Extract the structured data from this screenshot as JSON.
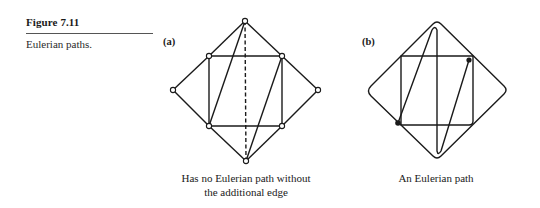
{
  "figure": {
    "label": "Figure 7.11",
    "caption": "Eulerian paths."
  },
  "panels": [
    {
      "id": "a",
      "label": "(a)",
      "caption_line1": "Has no Eulerian path without",
      "caption_line2": "the additional edge",
      "vertices": [
        {
          "name": "top",
          "x": 245,
          "y": 21
        },
        {
          "name": "upper-left",
          "x": 209,
          "y": 56
        },
        {
          "name": "upper-right",
          "x": 282,
          "y": 56
        },
        {
          "name": "left",
          "x": 173,
          "y": 90
        },
        {
          "name": "right",
          "x": 318,
          "y": 90
        },
        {
          "name": "lower-left",
          "x": 209,
          "y": 126
        },
        {
          "name": "lower-right",
          "x": 282,
          "y": 126
        },
        {
          "name": "bottom",
          "x": 246,
          "y": 161
        }
      ],
      "edges": [
        [
          "top",
          "upper-left"
        ],
        [
          "top",
          "upper-right"
        ],
        [
          "upper-left",
          "left"
        ],
        [
          "upper-right",
          "right"
        ],
        [
          "left",
          "lower-left"
        ],
        [
          "right",
          "lower-right"
        ],
        [
          "lower-left",
          "bottom"
        ],
        [
          "lower-right",
          "bottom"
        ],
        [
          "upper-left",
          "upper-right"
        ],
        [
          "upper-left",
          "lower-left"
        ],
        [
          "upper-right",
          "lower-right"
        ],
        [
          "lower-left",
          "lower-right"
        ],
        [
          "top",
          "lower-left"
        ],
        [
          "upper-right",
          "bottom"
        ]
      ],
      "dashed_edges": [
        [
          "top",
          "bottom"
        ]
      ]
    },
    {
      "id": "b",
      "label": "(b)",
      "caption_line1": "An Eulerian path",
      "start_dot": {
        "x": 398,
        "y": 123
      },
      "end_dot": {
        "x": 469,
        "y": 60
      }
    }
  ]
}
